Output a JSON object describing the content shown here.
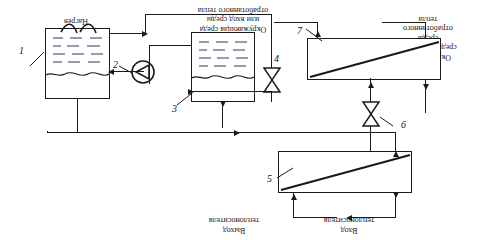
{
  "figure": {
    "orientation": "rotated-180",
    "line_color": "#1a1a1a",
    "background": "#ffffff"
  },
  "labels": {
    "heating": "Нагрев",
    "ambient_in": "Окружающая среда\nили вход среды\nотработанного тепла",
    "ambient_out": "Окружающая\nсреды или выход\nсреды\nотработанного\nтепла",
    "coolant_out": "Выход\nтеплоносителя",
    "coolant_in": "Вход\nтеплоносителя"
  },
  "components": [
    {
      "id": "1",
      "name": "Испаритель-бак",
      "type": "tank"
    },
    {
      "id": "2",
      "name": "Насос",
      "type": "pump"
    },
    {
      "id": "3",
      "name": "Бак-аккумулятор",
      "type": "tank"
    },
    {
      "id": "4",
      "name": "Вентиль",
      "type": "valve"
    },
    {
      "id": "5",
      "name": "Теплообменник",
      "type": "heat-exchanger"
    },
    {
      "id": "6",
      "name": "Вентиль",
      "type": "valve"
    },
    {
      "id": "7",
      "name": "Теплообменник",
      "type": "heat-exchanger"
    }
  ],
  "numbers": {
    "n1": "1",
    "n2": "2",
    "n3": "3",
    "n4": "4",
    "n5": "5",
    "n6": "6",
    "n7": "7"
  }
}
